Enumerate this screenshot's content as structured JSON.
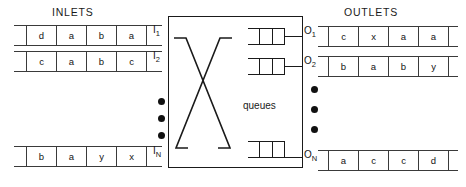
{
  "headings": {
    "inlets": "INLETS",
    "outlets": "OUTLETS"
  },
  "switch": {
    "queues_label": "queues",
    "crossbar_icon": "crossbar-x-icon"
  },
  "inlets": [
    {
      "label": "I",
      "sub": "1",
      "cells": [
        "d",
        "a",
        "b",
        "a"
      ]
    },
    {
      "label": "I",
      "sub": "2",
      "cells": [
        "c",
        "a",
        "b",
        "c"
      ]
    },
    {
      "label": "I",
      "sub": "N",
      "cells": [
        "b",
        "a",
        "y",
        "x"
      ]
    }
  ],
  "outlets": [
    {
      "label": "O",
      "sub": "1",
      "cells": [
        "c",
        "x",
        "a",
        "a"
      ]
    },
    {
      "label": "O",
      "sub": "2",
      "cells": [
        "b",
        "a",
        "b",
        "y"
      ]
    },
    {
      "label": "O",
      "sub": "N",
      "cells": [
        "a",
        "c",
        "c",
        "d"
      ]
    }
  ],
  "ellipsis": {
    "inlet_dots": 3,
    "outlet_dots": 3
  },
  "colors": {
    "line": "#1a1a1a",
    "tape_line": "#3a3a3a",
    "text": "#141414",
    "background": "#ffffff"
  }
}
